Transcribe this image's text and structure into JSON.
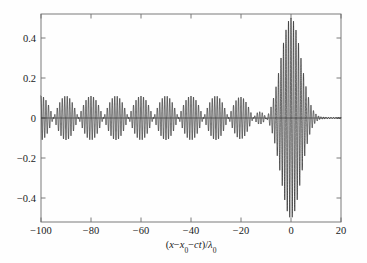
{
  "figure": {
    "background_color": "#fefefe",
    "frame_color": "#6e6e6e",
    "curve_color": "#0d0d0d"
  },
  "axes": {
    "x_label_parts": {
      "open_paren": "(",
      "x": "x",
      "minus1": "−",
      "x0_base": "x",
      "x0_sub": "0",
      "minus2": "−",
      "ct": "ct",
      "close_slash": ")/",
      "lambda": "λ",
      "lambda_sub": "0"
    },
    "x_label_plain": "(x − x₀ − ct)/λ₀",
    "y_label": "",
    "x_ticks": [
      "−100",
      "−80",
      "−60",
      "−40",
      "−20",
      "0",
      "20"
    ],
    "x_tick_values": [
      -100,
      -80,
      -60,
      -40,
      -20,
      0,
      20
    ],
    "y_ticks": [
      "0.4",
      "0.2",
      "0",
      "−0.2",
      "−0.4"
    ],
    "y_tick_values": [
      0.4,
      0.2,
      0,
      -0.2,
      -0.4
    ],
    "xlim": [
      -100,
      20
    ],
    "ylim": [
      -0.52,
      0.52
    ]
  },
  "chart_data": {
    "type": "line",
    "title": "",
    "xlabel": "(x − x₀ − ct)/λ₀",
    "ylabel": "",
    "xlim": [
      -100,
      20
    ],
    "ylim": [
      -0.52,
      0.52
    ],
    "grid": false,
    "legend": null,
    "series": [
      {
        "name": "field amplitude",
        "carrier_period": 1.0,
        "beat_envelope_amplitude": 0.11,
        "beat_envelope_period": 20.0,
        "beat_envelope_range": [
          -100,
          -13
        ],
        "burst_center": 0.0,
        "burst_peak_amplitude": 0.5,
        "burst_half_width": 7.5,
        "tail_decay_length": 4.0,
        "tail_amplitude_at_x5": 0.06,
        "annotated_points": [
          {
            "x": -95,
            "y": 0.11
          },
          {
            "x": -85,
            "y": -0.105
          },
          {
            "x": -75,
            "y": 0.11
          },
          {
            "x": -65,
            "y": -0.105
          },
          {
            "x": -55,
            "y": 0.105
          },
          {
            "x": -45,
            "y": -0.105
          },
          {
            "x": -35,
            "y": 0.105
          },
          {
            "x": -25,
            "y": -0.1
          },
          {
            "x": -15,
            "y": 0.105
          },
          {
            "x": -8,
            "y": -0.16
          },
          {
            "x": -4,
            "y": 0.32
          },
          {
            "x": 0,
            "y": 0.5
          },
          {
            "x": 2,
            "y": -0.47
          },
          {
            "x": 6,
            "y": 0.16
          },
          {
            "x": 12,
            "y": 0.03
          },
          {
            "x": 18,
            "y": 0.01
          }
        ]
      }
    ]
  }
}
